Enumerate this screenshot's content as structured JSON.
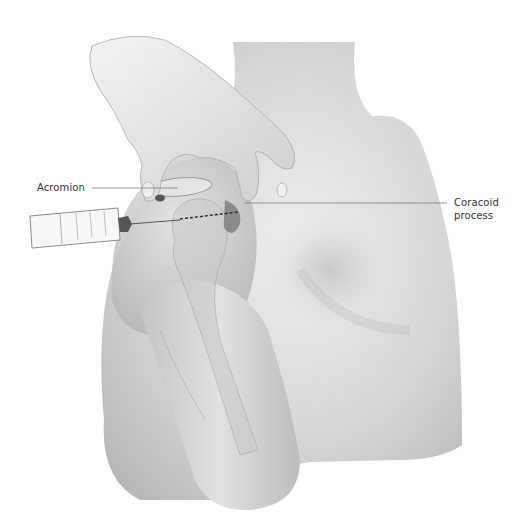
{
  "figure": {
    "type": "medical-illustration",
    "background_color": "#ffffff",
    "skin_tone": "#d9d9d9",
    "labels": [
      {
        "id": "acromion",
        "text": "Acromion"
      },
      {
        "id": "coracoid",
        "line1": "Coracoid",
        "line2": "process"
      }
    ],
    "elements": [
      "hand-palpating",
      "syringe-with-needle",
      "humerus-head",
      "acromion-bone",
      "coracoid-process",
      "needle-trajectory-dashed"
    ]
  }
}
